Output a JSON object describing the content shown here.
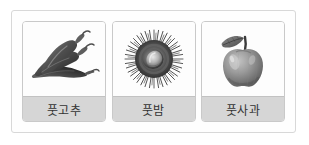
{
  "figure": {
    "type": "image-card-row",
    "background_color": "#ffffff",
    "frame_border_color": "#d8d8d8",
    "label_band_color": "#d6d6d6",
    "label_text_color": "#333333",
    "card_count": 3
  },
  "cards": [
    {
      "id": "card-green-pepper",
      "label": "풋고추",
      "image_name": "green-chili-peppers-photo",
      "image_alt": "풋고추",
      "image_style": "grayscale photograph of several chili peppers with stems"
    },
    {
      "id": "card-green-chestnut",
      "label": "풋밤",
      "image_name": "green-chestnut-burr-photo",
      "image_alt": "풋밤",
      "image_style": "grayscale photograph of a spiky chestnut burr opened"
    },
    {
      "id": "card-green-apple",
      "label": "풋사과",
      "image_name": "green-apple-photo",
      "image_alt": "풋사과",
      "image_style": "grayscale photograph of an apple with a leaf and stem"
    }
  ]
}
